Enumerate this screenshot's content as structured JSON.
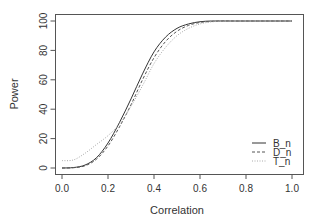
{
  "chart_data": {
    "type": "line",
    "title": "",
    "xlabel": "Correlation",
    "ylabel": "Power",
    "xlim": [
      0.0,
      1.0
    ],
    "ylim": [
      0,
      100
    ],
    "xticks": [
      "0.0",
      "0.2",
      "0.4",
      "0.6",
      "0.8",
      "1.0"
    ],
    "yticks": [
      "0",
      "20",
      "40",
      "60",
      "80",
      "100"
    ],
    "grid": false,
    "legend_position": "bottom-right",
    "x": [
      0.0,
      0.05,
      0.1,
      0.15,
      0.2,
      0.25,
      0.3,
      0.35,
      0.4,
      0.45,
      0.5,
      0.55,
      0.6,
      0.65,
      0.7,
      0.75,
      0.8,
      0.85,
      0.9,
      0.95,
      1.0
    ],
    "series": [
      {
        "name": "B_n",
        "style": "solid",
        "color": "#333333",
        "values": [
          0,
          0.3,
          2,
          7,
          17,
          31,
          47,
          64,
          79,
          89,
          95,
          98,
          99.5,
          100,
          100,
          100,
          100,
          100,
          100,
          100,
          100
        ]
      },
      {
        "name": "D_n",
        "style": "dashed",
        "color": "#555555",
        "values": [
          0,
          0.2,
          1.5,
          6,
          15,
          28,
          43,
          60,
          75,
          86,
          93,
          97,
          99,
          99.7,
          100,
          100,
          100,
          100,
          100,
          100,
          100
        ]
      },
      {
        "name": "T_n",
        "style": "dotted",
        "color": "#aaaaaa",
        "values": [
          5,
          5.5,
          10,
          16,
          22,
          30,
          42,
          56,
          71,
          82,
          90,
          95,
          98,
          99.4,
          99.8,
          100,
          100,
          100,
          100,
          100,
          100
        ]
      }
    ]
  }
}
